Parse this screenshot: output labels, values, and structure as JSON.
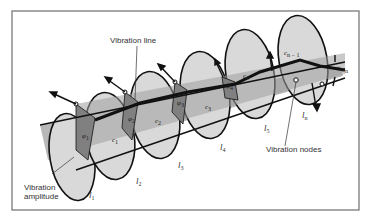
{
  "figure": {
    "type": "torsional vibration model of a shaft with discs",
    "colors": {
      "frame": "#6e6e6e",
      "disc_fill": "#d6d6d6",
      "band_fill": "#a9a9a9",
      "angle_fill": "#8a8a8a",
      "stroke": "#111111"
    }
  },
  "labels": {
    "vibration_line": "Vibration line",
    "vibration_amplitude_1": "Vibration",
    "vibration_amplitude_2": "amplitude",
    "vibration_nodes": "Vibration nodes"
  },
  "inertias": [
    {
      "base": "l",
      "sub": "1"
    },
    {
      "base": "l",
      "sub": "2"
    },
    {
      "base": "l",
      "sub": "3"
    },
    {
      "base": "l",
      "sub": "4"
    },
    {
      "base": "l",
      "sub": "5"
    },
    {
      "base": "l",
      "sub": "n"
    }
  ],
  "stiffnesses": [
    {
      "base": "c",
      "sub": "1"
    },
    {
      "base": "c",
      "sub": "2"
    },
    {
      "base": "c",
      "sub": "3"
    },
    {
      "base": "c",
      "sub": "4"
    },
    {
      "base": "c",
      "sub": "n − 1"
    }
  ],
  "angles": [
    {
      "base": "φ",
      "sub": "1"
    },
    {
      "base": "φ",
      "sub": "2"
    },
    {
      "base": "φ",
      "sub": "3"
    },
    {
      "base": "φ",
      "sub": "4"
    },
    {
      "base": "φ",
      "sub": "n"
    }
  ]
}
